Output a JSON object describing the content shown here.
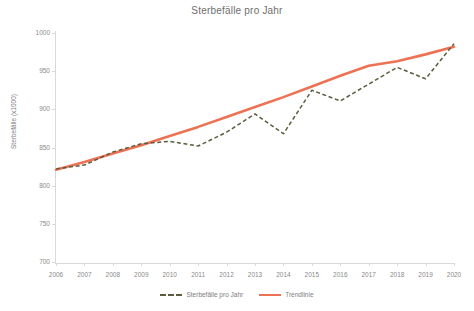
{
  "chart_data": {
    "type": "line",
    "title": "Sterbefälle pro Jahr",
    "xlabel": "",
    "ylabel": "Sterbefälle (x1000)",
    "categories": [
      "2006",
      "2007",
      "2008",
      "2009",
      "2010",
      "2011",
      "2012",
      "2013",
      "2014",
      "2015",
      "2016",
      "2017",
      "2018",
      "2019",
      "2020"
    ],
    "x": [
      2006,
      2007,
      2008,
      2009,
      2010,
      2011,
      2012,
      2013,
      2014,
      2015,
      2016,
      2017,
      2018,
      2019,
      2020
    ],
    "ylim": [
      700,
      1000
    ],
    "xlim": [
      2006,
      2020
    ],
    "yticks": [
      700,
      750,
      800,
      850,
      900,
      950,
      1000
    ],
    "grid": false,
    "legend_position": "bottom",
    "series": [
      {
        "name": "Sterbefälle pro Jahr",
        "style": "dashed",
        "color": "#5c5c3d",
        "values": [
          822,
          827,
          844,
          855,
          858,
          852,
          870,
          894,
          868,
          925,
          911,
          933,
          955,
          940,
          986
        ]
      },
      {
        "name": "Trendlinie",
        "style": "solid",
        "color": "#ED7254",
        "values": [
          821,
          831,
          842,
          853,
          865,
          877,
          890,
          903,
          916,
          930,
          944,
          957,
          963,
          972,
          982
        ]
      }
    ]
  },
  "legend": {
    "items": [
      {
        "label": "Sterbefälle pro Jahr"
      },
      {
        "label": "Trendlinie"
      }
    ]
  }
}
